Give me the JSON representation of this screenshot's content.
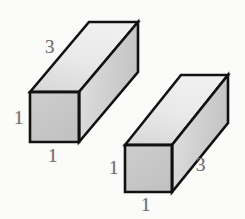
{
  "figure": {
    "background_color": "#fbfbfa",
    "outline_color": "#111111",
    "label_color": "#6e6e6e",
    "projection": "oblique",
    "depth_offset": {
      "dx": 59,
      "dy": -70
    },
    "shapes": [
      {
        "id": "left-prism",
        "name": "left-rectangular-prism",
        "dimensions": {
          "width": "1",
          "height": "1",
          "depth": "3"
        },
        "front_face": {
          "x": 30,
          "y": 92,
          "w": 49,
          "h": 50
        },
        "faces": {
          "front": {
            "name": "front-face",
            "fill": "#c9c9c9"
          },
          "top": {
            "name": "top-face",
            "fill": "#e6e6e6"
          },
          "right": {
            "name": "right-face",
            "fill": "#d2d2d2"
          }
        },
        "labels": [
          {
            "name": "left-prism-depth-label",
            "text": "3",
            "x": 45,
            "y": 37
          },
          {
            "name": "left-prism-height-label",
            "text": "1",
            "x": 14,
            "y": 108
          },
          {
            "name": "left-prism-width-label",
            "text": "1",
            "x": 48,
            "y": 146
          }
        ]
      },
      {
        "id": "right-prism",
        "name": "right-rectangular-prism",
        "dimensions": {
          "width": "1",
          "height": "1",
          "depth": "3"
        },
        "front_face": {
          "x": 125,
          "y": 145,
          "w": 47,
          "h": 47
        },
        "faces": {
          "front": {
            "name": "front-face",
            "fill": "#c9c9c9"
          },
          "top": {
            "name": "top-face",
            "fill": "#e6e6e6"
          },
          "right": {
            "name": "right-face",
            "fill": "#d2d2d2"
          }
        },
        "labels": [
          {
            "name": "right-prism-height-label",
            "text": "1",
            "x": 109,
            "y": 158
          },
          {
            "name": "right-prism-width-label",
            "text": "1",
            "x": 141,
            "y": 195
          },
          {
            "name": "right-prism-depth-label",
            "text": "3",
            "x": 196,
            "y": 155
          }
        ]
      }
    ]
  }
}
